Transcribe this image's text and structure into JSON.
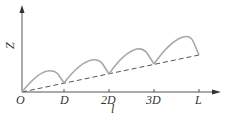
{
  "diagram": {
    "y_axis_label": "Z",
    "x_axis_label": "l",
    "origin_label": "O",
    "ticks": [
      {
        "label": "D",
        "x": 64
      },
      {
        "label": "2D",
        "x": 109
      },
      {
        "label": "3D",
        "x": 154
      },
      {
        "label": "L",
        "x": 199
      }
    ],
    "colors": {
      "axis": "#555555",
      "curve": "#a8a8a8",
      "dashed": "#555555"
    },
    "curve_description": "sawtooth of rising arcs above an increasing dashed baseline, 4 segments from O to L",
    "arcs": [
      {
        "start": [
          22,
          92
        ],
        "peak": [
          52,
          70
        ],
        "end": [
          64,
          83
        ]
      },
      {
        "start": [
          64,
          83
        ],
        "peak": [
          97,
          59
        ],
        "end": [
          109,
          74
        ]
      },
      {
        "start": [
          109,
          74
        ],
        "peak": [
          141,
          48
        ],
        "end": [
          154,
          64
        ]
      },
      {
        "start": [
          154,
          64
        ],
        "peak": [
          188,
          36
        ],
        "end": [
          199,
          55
        ]
      }
    ],
    "baseline": {
      "start": [
        22,
        92
      ],
      "end": [
        199,
        55
      ],
      "style": "dashed"
    }
  }
}
